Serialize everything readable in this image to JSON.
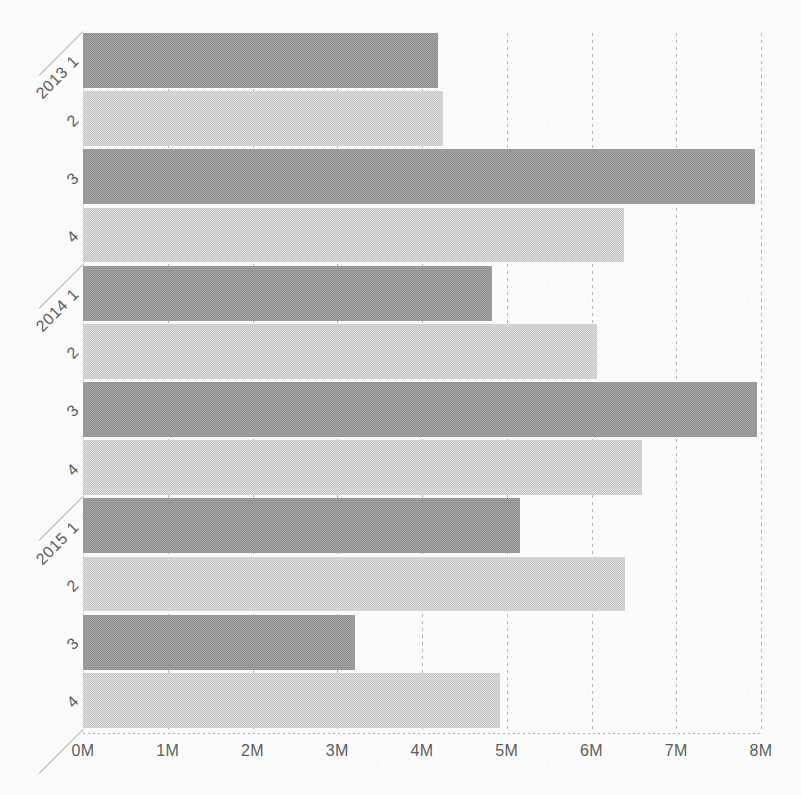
{
  "chart_data": {
    "type": "bar",
    "orientation": "horizontal",
    "title": "",
    "subtitle": "",
    "xlabel": "",
    "ylabel": "",
    "xlim": [
      0,
      8000000
    ],
    "ylim": null,
    "grid": true,
    "legend": null,
    "xticks": [
      {
        "value": 0,
        "label": "0M"
      },
      {
        "value": 1000000,
        "label": "1M"
      },
      {
        "value": 2000000,
        "label": "2M"
      },
      {
        "value": 3000000,
        "label": "3M"
      },
      {
        "value": 4000000,
        "label": "4M"
      },
      {
        "value": 5000000,
        "label": "5M"
      },
      {
        "value": 6000000,
        "label": "6M"
      },
      {
        "value": 7000000,
        "label": "7M"
      },
      {
        "value": 8000000,
        "label": "8M"
      }
    ],
    "groups": [
      {
        "year": "2013",
        "quarters": [
          "1",
          "2",
          "3",
          "4"
        ]
      },
      {
        "year": "2014",
        "quarters": [
          "1",
          "2",
          "3",
          "4"
        ]
      },
      {
        "year": "2015",
        "quarters": [
          "1",
          "2",
          "3",
          "4"
        ]
      }
    ],
    "categories": [
      "2013 1",
      "2013 2",
      "2013 3",
      "2013 4",
      "2014 1",
      "2014 2",
      "2014 3",
      "2014 4",
      "2015 1",
      "2015 2",
      "2015 3",
      "2015 4"
    ],
    "values": [
      4190000,
      4250000,
      7930000,
      6380000,
      4830000,
      6070000,
      7950000,
      6600000,
      5160000,
      6400000,
      3210000,
      4920000
    ],
    "bars": [
      {
        "year": "2013",
        "quarter": "1",
        "label": "2013 1",
        "value": 4190000,
        "shade": "dark"
      },
      {
        "year": "2013",
        "quarter": "2",
        "label": "2",
        "value": 4250000,
        "shade": "light"
      },
      {
        "year": "2013",
        "quarter": "3",
        "label": "3",
        "value": 7930000,
        "shade": "dark"
      },
      {
        "year": "2013",
        "quarter": "4",
        "label": "4",
        "value": 6380000,
        "shade": "light"
      },
      {
        "year": "2014",
        "quarter": "1",
        "label": "2014 1",
        "value": 4830000,
        "shade": "dark"
      },
      {
        "year": "2014",
        "quarter": "2",
        "label": "2",
        "value": 6070000,
        "shade": "light"
      },
      {
        "year": "2014",
        "quarter": "3",
        "label": "3",
        "value": 7950000,
        "shade": "dark"
      },
      {
        "year": "2014",
        "quarter": "4",
        "label": "4",
        "value": 6600000,
        "shade": "light"
      },
      {
        "year": "2015",
        "quarter": "1",
        "label": "2015 1",
        "value": 5160000,
        "shade": "dark"
      },
      {
        "year": "2015",
        "quarter": "2",
        "label": "2",
        "value": 6400000,
        "shade": "light"
      },
      {
        "year": "2015",
        "quarter": "3",
        "label": "3",
        "value": 3210000,
        "shade": "dark"
      },
      {
        "year": "2015",
        "quarter": "4",
        "label": "4",
        "value": 4920000,
        "shade": "light"
      }
    ],
    "colors": {
      "bar_dark": "#8e8e8e",
      "bar_light": "#c4c4c4",
      "grid": "#9a9a9a",
      "text": "#5a5a5a",
      "background": "#fbfbfb"
    }
  }
}
